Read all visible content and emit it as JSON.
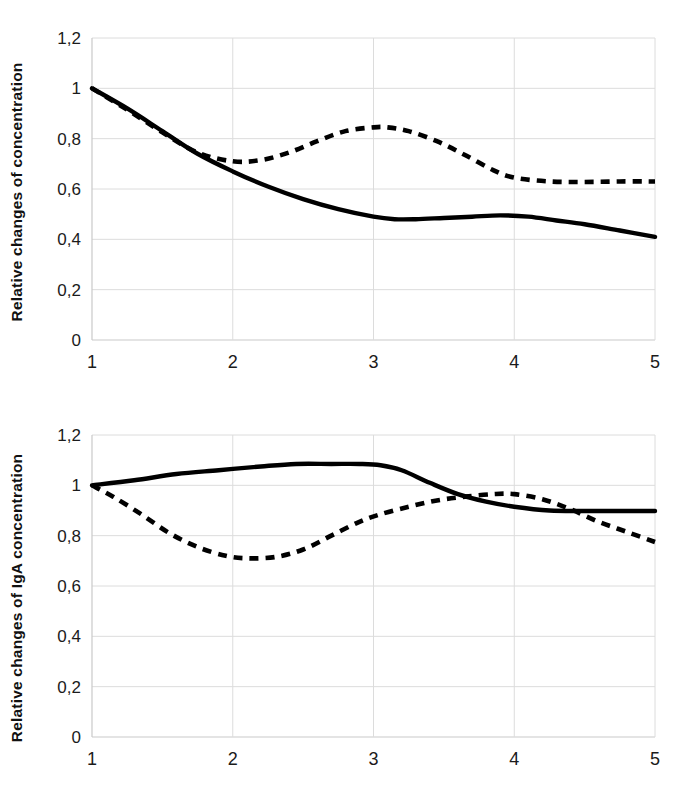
{
  "chart_data": [
    {
      "id": "top",
      "type": "line",
      "title": "",
      "xlabel": "",
      "ylabel": "Relative changes of concentration",
      "xlim": [
        1,
        5
      ],
      "ylim": [
        0,
        1.2
      ],
      "grid": true,
      "legend": "none",
      "xticks": [
        "1",
        "2",
        "3",
        "4",
        "5"
      ],
      "xtick_values": [
        1,
        2,
        3,
        4,
        5
      ],
      "yticks": [
        "0",
        "0,2",
        "0,4",
        "0,6",
        "0,8",
        "1",
        "1,2"
      ],
      "ytick_values": [
        0,
        0.2,
        0.4,
        0.6,
        0.8,
        1.0,
        1.2
      ],
      "series": [
        {
          "name": "solid-series",
          "style": "solid",
          "color": "#000000",
          "x": [
            1.0,
            1.25,
            1.5,
            1.75,
            2.0,
            2.25,
            2.5,
            2.75,
            3.0,
            3.15,
            3.3,
            3.5,
            3.7,
            3.9,
            4.1,
            4.3,
            4.5,
            4.75,
            5.0
          ],
          "values": [
            1.0,
            0.92,
            0.83,
            0.74,
            0.67,
            0.61,
            0.56,
            0.52,
            0.49,
            0.48,
            0.48,
            0.485,
            0.49,
            0.495,
            0.49,
            0.475,
            0.46,
            0.435,
            0.41
          ]
        },
        {
          "name": "dashed-series",
          "style": "dashed",
          "color": "#000000",
          "x": [
            1.0,
            1.25,
            1.5,
            1.75,
            2.0,
            2.2,
            2.4,
            2.6,
            2.8,
            3.0,
            3.1,
            3.25,
            3.45,
            3.65,
            3.85,
            4.0,
            4.25,
            4.5,
            4.75,
            5.0
          ],
          "values": [
            1.0,
            0.915,
            0.825,
            0.745,
            0.71,
            0.715,
            0.745,
            0.79,
            0.83,
            0.845,
            0.845,
            0.83,
            0.79,
            0.735,
            0.675,
            0.645,
            0.63,
            0.628,
            0.63,
            0.63
          ]
        }
      ]
    },
    {
      "id": "bottom",
      "type": "line",
      "title": "",
      "xlabel": "",
      "ylabel": "Relative changes of IgA concentration",
      "xlim": [
        1,
        5
      ],
      "ylim": [
        0,
        1.2
      ],
      "grid": true,
      "legend": "none",
      "xticks": [
        "1",
        "2",
        "3",
        "4",
        "5"
      ],
      "xtick_values": [
        1,
        2,
        3,
        4,
        5
      ],
      "yticks": [
        "0",
        "0,2",
        "0,4",
        "0,6",
        "0,8",
        "1",
        "1,2"
      ],
      "ytick_values": [
        0,
        0.2,
        0.4,
        0.6,
        0.8,
        1.0,
        1.2
      ],
      "series": [
        {
          "name": "solid-series",
          "style": "solid",
          "color": "#000000",
          "x": [
            1.0,
            1.3,
            1.6,
            1.9,
            2.2,
            2.45,
            2.7,
            2.9,
            3.05,
            3.2,
            3.4,
            3.6,
            3.8,
            4.0,
            4.25,
            4.5,
            4.75,
            5.0
          ],
          "values": [
            1.0,
            1.02,
            1.045,
            1.06,
            1.075,
            1.085,
            1.085,
            1.085,
            1.08,
            1.06,
            1.01,
            0.965,
            0.935,
            0.915,
            0.9,
            0.898,
            0.898,
            0.898
          ]
        },
        {
          "name": "dashed-series",
          "style": "dashed",
          "color": "#000000",
          "x": [
            1.0,
            1.15,
            1.35,
            1.55,
            1.75,
            1.95,
            2.1,
            2.3,
            2.5,
            2.7,
            2.9,
            3.05,
            3.25,
            3.45,
            3.65,
            3.85,
            4.0,
            4.2,
            4.4,
            4.6,
            4.8,
            5.0
          ],
          "values": [
            1.0,
            0.955,
            0.885,
            0.81,
            0.755,
            0.72,
            0.71,
            0.715,
            0.745,
            0.8,
            0.855,
            0.885,
            0.915,
            0.94,
            0.955,
            0.965,
            0.965,
            0.945,
            0.905,
            0.855,
            0.815,
            0.775
          ]
        }
      ]
    }
  ]
}
